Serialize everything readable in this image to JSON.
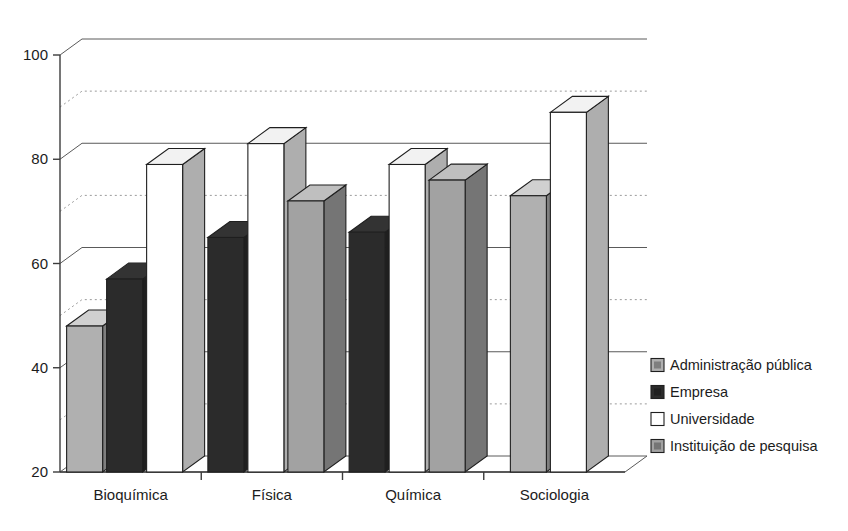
{
  "chart_data": {
    "type": "bar",
    "title": "",
    "subtitle": "",
    "xlabel": "",
    "ylabel": "",
    "categories": [
      "Bioquímica",
      "Física",
      "Química",
      "Sociologia"
    ],
    "series": [
      {
        "name": "Administração pública",
        "color": "#b0b0b0",
        "values": [
          48,
          null,
          null,
          73
        ]
      },
      {
        "name": "Empresa",
        "color": "#2b2b2b",
        "values": [
          57,
          65,
          66,
          null
        ]
      },
      {
        "name": "Universidade",
        "color": "#ffffff",
        "values": [
          79,
          83,
          79,
          89
        ]
      },
      {
        "name": "Instituição de pesquisa",
        "color": "#a2a2a2",
        "values": [
          null,
          72,
          76,
          null
        ]
      }
    ],
    "ylim": [
      20,
      100
    ],
    "y_ticks": [
      20,
      40,
      60,
      80,
      100
    ],
    "y_tick_labels": [
      "20",
      "40",
      "60",
      "80",
      "100"
    ],
    "y_minor_gridlines": [
      30,
      50,
      70,
      90
    ],
    "grid": "major-solid-minor-dotted",
    "legend_position": "right",
    "projection": "3d-extruded-columns"
  },
  "legend": {
    "items": [
      {
        "label": "Administração pública",
        "swatch": "#b0b0b0"
      },
      {
        "label": "Empresa",
        "swatch": "#2b2b2b"
      },
      {
        "label": "Universidade",
        "swatch": "#ffffff"
      },
      {
        "label": "Instituição de pesquisa",
        "swatch": "#a2a2a2"
      }
    ]
  },
  "colors": {
    "administracao": "#b0b0b0",
    "empresa": "#2b2b2b",
    "universidade": "#ffffff",
    "instituicao": "#a2a2a2",
    "outline": "#1f1f1f",
    "grid_major": "#5a5a5a",
    "grid_minor": "#9a9a9a",
    "background": "#ffffff",
    "text": "#1c1c1c"
  }
}
